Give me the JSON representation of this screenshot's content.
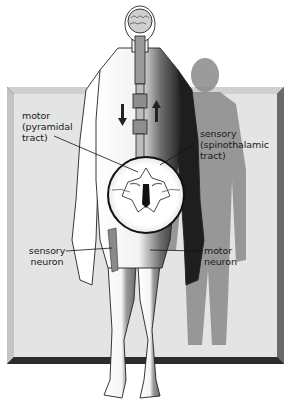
{
  "diagram": {
    "title": "",
    "colors": {
      "background": "#ffffff",
      "panel": "#e3e3e3",
      "panel_bevel_light": "#c9c9c9",
      "panel_bevel_dark": "#3a3a3a",
      "body_outline": "#222222",
      "shadow": "#7a7a7a",
      "body_dark": "#2a2a2a"
    },
    "labels": {
      "motor_tract": [
        "motor",
        "(pyramidal",
        "tract)"
      ],
      "sensory_tract": [
        "sensory",
        "(spinothalamic",
        "tract)"
      ],
      "sensory_neuron": [
        "sensory",
        "neuron"
      ],
      "motor_neuron": [
        "motor",
        "neuron"
      ]
    },
    "arrows": {
      "descending": "down",
      "ascending": "up"
    }
  }
}
